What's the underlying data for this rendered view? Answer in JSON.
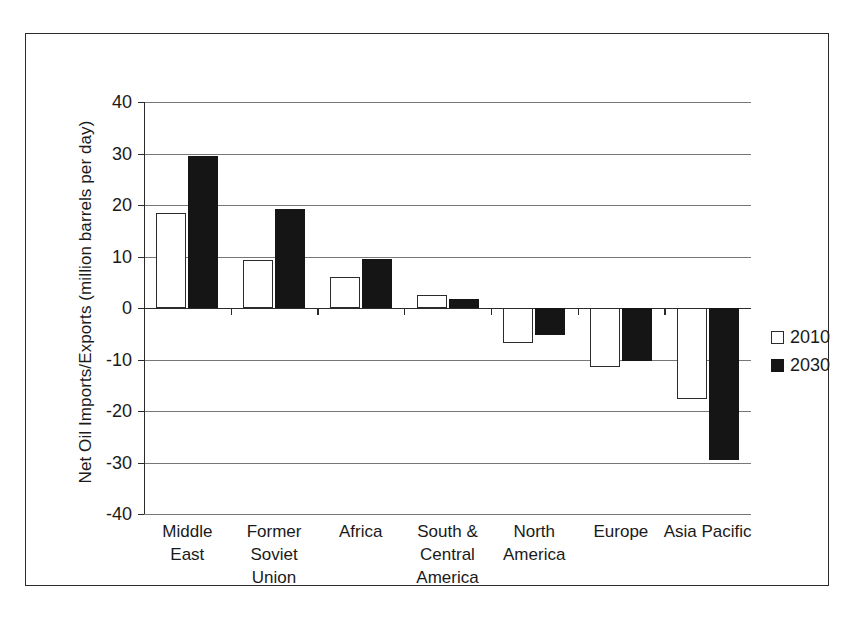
{
  "chart_data": {
    "type": "bar",
    "title": "",
    "xlabel": "",
    "ylabel": "Net Oil Imports/Exports (million barrels per day)",
    "ylim": [
      -40,
      40
    ],
    "yticks": [
      40,
      30,
      20,
      10,
      0,
      -10,
      -20,
      -30,
      -40
    ],
    "ytick_labels": [
      "40",
      "30",
      "20",
      "10",
      "0",
      "-10",
      "-20",
      "-30",
      "-40"
    ],
    "grid": true,
    "legend_position": "right",
    "categories": [
      "Middle East",
      "Former Soviet Union",
      "Africa",
      "South & Central America",
      "North America",
      "Europe",
      "Asia Pacific"
    ],
    "category_lines": [
      [
        "Middle",
        "East"
      ],
      [
        "Former",
        "Soviet",
        "Union"
      ],
      [
        "Africa"
      ],
      [
        "South &",
        "Central",
        "America"
      ],
      [
        "North",
        "America"
      ],
      [
        "Europe"
      ],
      [
        "Asia Pacific"
      ]
    ],
    "series": [
      {
        "name": "2010",
        "color": "#ffffff",
        "edge_color": "#2b2b2b",
        "values": [
          18.5,
          9.3,
          6.0,
          2.5,
          -6.8,
          -11.5,
          -17.7
        ]
      },
      {
        "name": "2030",
        "color": "#151515",
        "edge_color": "#151515",
        "values": [
          29.5,
          19.2,
          9.5,
          1.8,
          -5.3,
          -10.2,
          -29.5
        ]
      }
    ]
  },
  "legend": {
    "items": [
      {
        "label": "2010",
        "swatch": "white-square"
      },
      {
        "label": "2030",
        "swatch": "black-square"
      }
    ]
  },
  "colors": {
    "frame": "#2b2b2b",
    "axis": "#2b2b2b",
    "gridline": "#777777",
    "series_2010": "#ffffff",
    "series_2030": "#151515",
    "background": "#ffffff"
  }
}
